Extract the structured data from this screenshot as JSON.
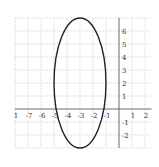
{
  "chart_data": {
    "type": "line",
    "title": "",
    "xlabel": "",
    "ylabel": "",
    "xlim": [
      -8,
      2.5
    ],
    "ylim": [
      -3,
      7
    ],
    "grid": true,
    "x_ticks": [
      -8,
      -7,
      -6,
      -5,
      -4,
      -3,
      -2,
      -1,
      1,
      2
    ],
    "x_tick_labels": [
      "1",
      "-7",
      "-6",
      "-5",
      "-4",
      "-3",
      "-2",
      "-1",
      "1",
      "2"
    ],
    "y_ticks": [
      6,
      5,
      4,
      3,
      2,
      1,
      -1,
      -2
    ],
    "y_tick_labels": [
      "6",
      "5",
      "4",
      "3",
      "2",
      "1",
      "-1",
      "-2"
    ],
    "series": [
      {
        "name": "ellipse",
        "shape": "ellipse",
        "center": [
          -3,
          2
        ],
        "semi_axis_x": 2,
        "semi_axis_y": 5,
        "equation": "(x+3)^2/4 + (y-2)^2/25 = 1",
        "color": "#222222"
      }
    ],
    "pixel_mapping": {
      "origin_px": [
        119,
        109
      ],
      "unit_px": 13
    }
  }
}
